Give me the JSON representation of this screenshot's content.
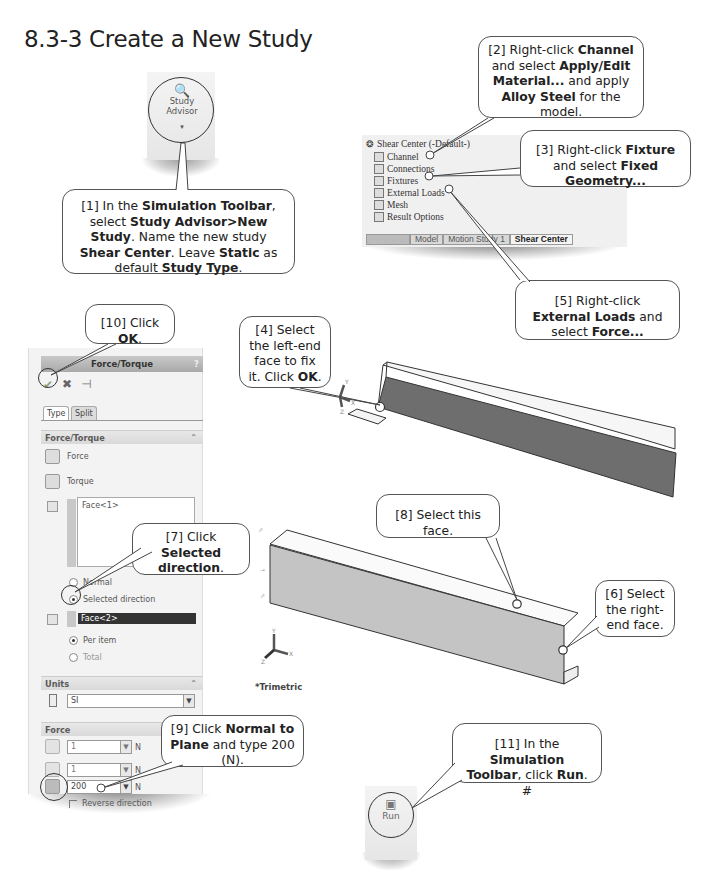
{
  "page": {
    "title": "8.3-3  Create a New Study"
  },
  "toolbar_buttons": {
    "study_advisor": {
      "icon": "magnifier-icon",
      "label_line1": "Study",
      "label_line2": "Advisor",
      "dropdown": "▾"
    },
    "run": {
      "icon": "run-icon",
      "label": "Run"
    }
  },
  "feature_tree": {
    "root": "Shear Center (-Default-)",
    "items": [
      {
        "label": "Channel",
        "icon": "part-icon"
      },
      {
        "label": "Connections",
        "icon": "connections-icon"
      },
      {
        "label": "Fixtures",
        "icon": "fixtures-icon"
      },
      {
        "label": "External Loads",
        "icon": "external-loads-icon"
      },
      {
        "label": "Mesh",
        "icon": "mesh-icon"
      },
      {
        "label": "Result Options",
        "icon": "result-options-icon"
      }
    ],
    "tabs": [
      {
        "label": "Model",
        "active": false
      },
      {
        "label": "Motion Study 1",
        "active": false
      },
      {
        "label": "Shear Center",
        "active": true
      }
    ]
  },
  "property_manager": {
    "title": "Force/Torque",
    "help": "?",
    "actions": {
      "ok": "✔",
      "cancel": "✖",
      "pin": "⊣"
    },
    "tabs": [
      "Type",
      "Split"
    ],
    "sections": {
      "force_torque": {
        "label": "Force/Torque",
        "options": [
          "Force",
          "Torque"
        ],
        "faces_list": [
          "Face<1>"
        ],
        "direction_options": [
          {
            "label": "Normal",
            "selected": false
          },
          {
            "label": "Selected direction",
            "selected": true
          }
        ],
        "direction_face": "Face<2>",
        "distribution": [
          {
            "label": "Per item",
            "selected": true
          },
          {
            "label": "Total",
            "selected": false
          }
        ]
      },
      "units": {
        "label": "Units",
        "value": "SI"
      },
      "force": {
        "label": "Force",
        "rows": [
          {
            "value": "1",
            "unit": "N",
            "enabled": false
          },
          {
            "value": "1",
            "unit": "N",
            "enabled": false
          },
          {
            "value": "200",
            "unit": "N",
            "enabled": true
          }
        ],
        "reverse_direction": "Reverse direction"
      }
    }
  },
  "viewport": {
    "view_label": "*Trimetric",
    "axes": {
      "x": "X",
      "y": "Y",
      "z": "Z"
    }
  },
  "callouts": [
    {
      "id": "1",
      "parts": [
        [
          "[1] In the ",
          false
        ],
        [
          "Simulation Toolbar",
          true
        ],
        [
          ", select ",
          false
        ],
        [
          "Study Advisor>New Study",
          true
        ],
        [
          ". Name the new study ",
          false
        ],
        [
          "Shear Center",
          true
        ],
        [
          ". Leave ",
          false
        ],
        [
          "Static",
          true
        ],
        [
          " as default ",
          false
        ],
        [
          "Study Type",
          true
        ],
        [
          ".",
          false
        ]
      ]
    },
    {
      "id": "2",
      "parts": [
        [
          "[2] Right-click ",
          false
        ],
        [
          "Channel",
          true
        ],
        [
          " and select ",
          false
        ],
        [
          "Apply/Edit Material...",
          true
        ],
        [
          " and apply ",
          false
        ],
        [
          "Alloy Steel",
          true
        ],
        [
          " for the model.",
          false
        ]
      ]
    },
    {
      "id": "3",
      "parts": [
        [
          "[3] Right-click ",
          false
        ],
        [
          "Fixture",
          true
        ],
        [
          " and select ",
          false
        ],
        [
          "Fixed Geometry...",
          true
        ]
      ]
    },
    {
      "id": "4",
      "parts": [
        [
          "[4] Select the left-end face to fix it. Click ",
          false
        ],
        [
          "OK",
          true
        ],
        [
          ".",
          false
        ]
      ]
    },
    {
      "id": "5",
      "parts": [
        [
          "[5] Right-click ",
          false
        ],
        [
          "External Loads",
          true
        ],
        [
          " and select ",
          false
        ],
        [
          "Force...",
          true
        ]
      ]
    },
    {
      "id": "6",
      "parts": [
        [
          "[6] Select the right-end face.",
          false
        ]
      ]
    },
    {
      "id": "7",
      "parts": [
        [
          "[7] Click ",
          false
        ],
        [
          "Selected direction",
          true
        ],
        [
          ".",
          false
        ]
      ]
    },
    {
      "id": "8",
      "parts": [
        [
          "[8] Select this face.",
          false
        ]
      ]
    },
    {
      "id": "9",
      "parts": [
        [
          "[9] Click ",
          false
        ],
        [
          "Normal to Plane",
          true
        ],
        [
          " and type 200 (N).",
          false
        ]
      ]
    },
    {
      "id": "10",
      "parts": [
        [
          "[10] Click ",
          false
        ],
        [
          "OK",
          true
        ],
        [
          ".",
          false
        ]
      ]
    },
    {
      "id": "11",
      "parts": [
        [
          "[11] In the ",
          false
        ],
        [
          "Simulation Toolbar",
          true
        ],
        [
          ", click ",
          false
        ],
        [
          "Run",
          true
        ],
        [
          ". #",
          false
        ]
      ]
    }
  ],
  "colors": {
    "callout_border": "#555555",
    "face_dark": "#6e6e6e",
    "face_light": "#c4c4c4",
    "selection": "#333333"
  }
}
